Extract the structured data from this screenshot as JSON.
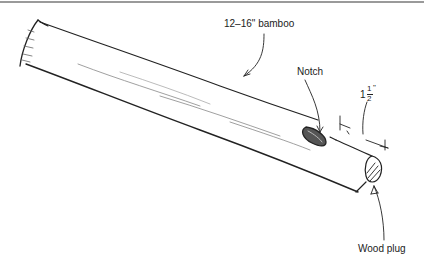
{
  "diagram": {
    "type": "illustration",
    "labels": {
      "bamboo": "12–16\" bamboo",
      "notch": "Notch",
      "length_whole": "1",
      "length_num": "1",
      "length_den": "2",
      "length_unit": "\"",
      "wood_plug": "Wood plug"
    },
    "colors": {
      "ink": "#222222",
      "shading": "#888888",
      "border": "#9a9a9a"
    }
  }
}
